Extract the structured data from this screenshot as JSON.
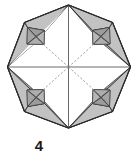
{
  "figure": {
    "caption": "4",
    "shape": "octagon",
    "step_number": "4",
    "colors": {
      "outline": "#2b2b2b",
      "shade_light": "#c9c9c9",
      "shade_mid": "#b2b2b2",
      "shade_dark": "#9a9a9a",
      "shade_darker": "#868686",
      "crease_solid": "#5a5a5a",
      "crease_dashed": "#7a7a7a",
      "background": "#ffffff",
      "caption_color": "#1a1a1a"
    },
    "geometry": {
      "center": [
        68.5,
        67
      ],
      "octagon_vertices": [
        [
          68.5,
          5
        ],
        [
          112.5,
          22.5
        ],
        [
          130.5,
          67
        ],
        [
          112.5,
          111.5
        ],
        [
          68.5,
          128
        ],
        [
          24.5,
          111.5
        ],
        [
          7.5,
          67
        ],
        [
          24.5,
          22.5
        ]
      ],
      "pocket_squares": [
        {
          "name": "top-left-pocket",
          "cx": 35.5,
          "cy": 36.0,
          "size": 17
        },
        {
          "name": "top-right-pocket",
          "cx": 101.5,
          "cy": 36.0,
          "size": 17
        },
        {
          "name": "bottom-left-pocket",
          "cx": 35.5,
          "cy": 98.0,
          "size": 17
        },
        {
          "name": "bottom-right-pocket",
          "cx": 101.5,
          "cy": 98.0,
          "size": 17
        }
      ],
      "radial_creases": [
        {
          "name": "crease-up",
          "style": "solid",
          "to": [
            68.5,
            5
          ]
        },
        {
          "name": "crease-down",
          "style": "solid",
          "to": [
            68.5,
            128
          ]
        },
        {
          "name": "crease-left",
          "style": "solid",
          "to": [
            7.5,
            67
          ]
        },
        {
          "name": "crease-right",
          "style": "solid",
          "to": [
            130.5,
            67
          ]
        },
        {
          "name": "crease-up-left",
          "style": "dashed",
          "to": [
            27.0,
            30.0
          ]
        },
        {
          "name": "crease-up-right",
          "style": "dashed",
          "to": [
            110.0,
            30.0
          ]
        },
        {
          "name": "crease-down-left",
          "style": "dashed",
          "to": [
            27.0,
            104.0
          ]
        },
        {
          "name": "crease-down-right",
          "style": "dashed",
          "to": [
            110.0,
            104.0
          ]
        }
      ]
    }
  }
}
